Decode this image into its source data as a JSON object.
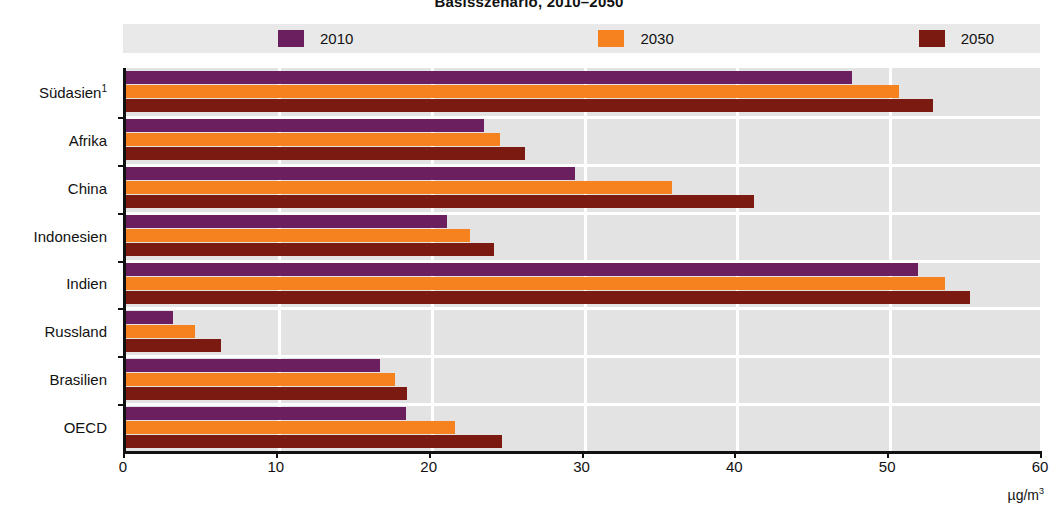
{
  "title": "Basisszenario, 2010–2050",
  "legend": {
    "position": "top",
    "items": [
      {
        "label": "2010",
        "color": "#6B1F5E"
      },
      {
        "label": "2030",
        "color": "#F5821F"
      },
      {
        "label": "2050",
        "color": "#7A1A10"
      }
    ]
  },
  "axis": {
    "unit": "µg/m",
    "unit_exp": "3",
    "ticks": [
      "0",
      "10",
      "20",
      "30",
      "40",
      "50",
      "60"
    ]
  },
  "chart_data": {
    "type": "bar",
    "orientation": "horizontal",
    "title": "Basisszenario, 2010–2050",
    "xlabel": "µg/m³",
    "ylabel": "",
    "xlim": [
      0,
      60
    ],
    "grid": true,
    "legend_position": "top",
    "categories": [
      "Südasien¹",
      "Afrika",
      "China",
      "Indonesien",
      "Indien",
      "Russland",
      "Brasilien",
      "OECD"
    ],
    "series": [
      {
        "name": "2010",
        "color": "#6B1F5E",
        "values": [
          47.5,
          23.4,
          29.4,
          21.0,
          51.8,
          3.1,
          16.6,
          18.3
        ]
      },
      {
        "name": "2030",
        "color": "#F5821F",
        "values": [
          50.6,
          24.5,
          35.7,
          22.5,
          53.6,
          4.5,
          17.6,
          21.5
        ]
      },
      {
        "name": "2050",
        "color": "#7A1A10",
        "values": [
          52.8,
          26.1,
          41.1,
          24.1,
          55.2,
          6.2,
          18.4,
          24.6
        ]
      }
    ]
  }
}
